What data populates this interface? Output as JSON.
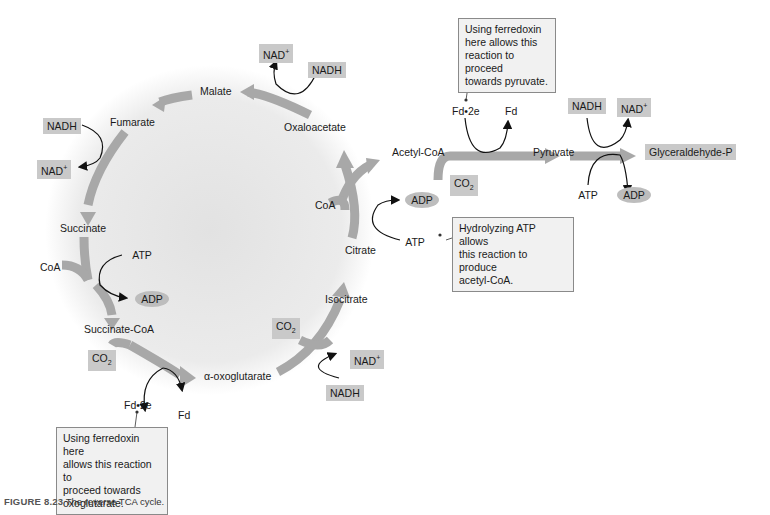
{
  "figure": {
    "number": "FIGURE 8.23",
    "caption": "The reverse TCA cycle."
  },
  "cycle_intermediates": {
    "malate": "Malate",
    "fumarate": "Fumarate",
    "succinate": "Succinate",
    "succinate_coa": "Succinate-CoA",
    "oxoglutarate": "α-oxoglutarate",
    "isocitrate": "Isocitrate",
    "citrate": "Citrate",
    "oxaloacetate": "Oxaloacetate"
  },
  "linear_path": {
    "acetyl_coa": "Acetyl-CoA",
    "pyruvate": "Pyruvate",
    "glyceraldehyde_p": "Glyceraldehyde-P"
  },
  "cofactors": {
    "oxaloacetate_malate": {
      "in": "NADH",
      "out": "NAD",
      "out_sup": "+"
    },
    "fumarate_succinate": {
      "in": "NADH",
      "out": "NAD",
      "out_sup": "+"
    },
    "succinate_coa": {
      "coa": "CoA",
      "atp": "ATP",
      "adp": "ADP"
    },
    "succinylcoa_oxoglutarate": {
      "co2": "CO",
      "co2_sub": "2",
      "fd_in": "Fd•2e",
      "fd_out": "Fd"
    },
    "oxoglutarate_isocitrate": {
      "co2": "CO",
      "co2_sub": "2",
      "in": "NADH",
      "out": "NAD",
      "out_sup": "+"
    },
    "citrate_cleavage": {
      "coa": "CoA",
      "atp": "ATP",
      "adp": "ADP"
    },
    "acetylcoa_pyruvate": {
      "co2": "CO",
      "co2_sub": "2",
      "fd_in": "Fd•2e",
      "fd_out": "Fd"
    },
    "pyruvate_glyceraldehyde": {
      "nadh": "NADH",
      "nad": "NAD",
      "nad_sup": "+",
      "atp": "ATP",
      "adp": "ADP"
    }
  },
  "notes": {
    "pyruvate_note": [
      "Using ferredoxin",
      "here allows this",
      "reaction to proceed",
      "towards pyruvate."
    ],
    "atp_note": [
      "Hydrolyzing ATP allows",
      "this reaction to produce",
      "acetyl-CoA."
    ],
    "oxoglutarate_note": [
      "Using ferredoxin here",
      "allows this reaction to",
      "proceed towards",
      "oxoglutarate."
    ]
  },
  "colors": {
    "arrow": "#a8a8a8",
    "box": "#c9c9c9",
    "note_bg": "#f1f1f1",
    "cycle_bg": "#e4e4e4"
  }
}
